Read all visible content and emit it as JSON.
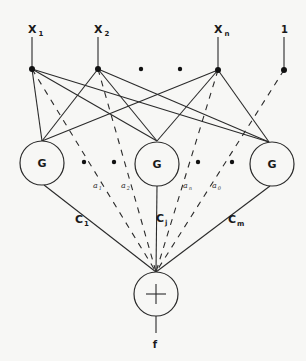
{
  "diagram": {
    "type": "neural-network",
    "inputs": [
      {
        "name": "X",
        "sub": "1"
      },
      {
        "name": "X",
        "sub": "2"
      },
      {
        "name": "X",
        "sub": "n"
      },
      {
        "name": "1",
        "sub": ""
      }
    ],
    "hidden_nodes": [
      {
        "label": "G"
      },
      {
        "label": "G"
      },
      {
        "label": "G"
      }
    ],
    "hidden_to_output_weights": [
      {
        "name": "C",
        "sub": "1"
      },
      {
        "name": "C",
        "sub": "j"
      },
      {
        "name": "C",
        "sub": "m"
      }
    ],
    "direct_weights": [
      {
        "name": "a",
        "sub": "1"
      },
      {
        "name": "a",
        "sub": "2"
      },
      {
        "name": "a",
        "sub": "n"
      },
      {
        "name": "a",
        "sub": "0"
      }
    ],
    "output_node": {
      "label": "+"
    },
    "output": {
      "label": "f"
    }
  }
}
